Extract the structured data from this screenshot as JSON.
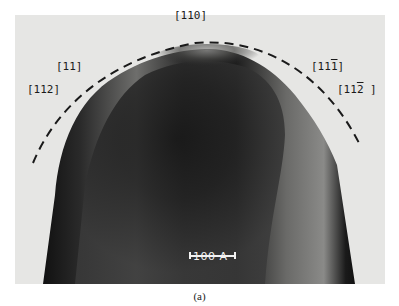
{
  "figure": {
    "caption": "(a)",
    "labels": {
      "top": "[110]",
      "upper_left": "[11]",
      "left": "[112]",
      "upper_right_prefix": "[11",
      "upper_right_bar_digit": "1",
      "upper_right_suffix": "]",
      "right_prefix": "[11",
      "right_bar_digit": "2",
      "right_suffix": " ]"
    },
    "scale_bar": {
      "label": "100 A"
    },
    "colors": {
      "background": "#e6e6e4",
      "specimen_dark": "#1c1c1c",
      "specimen_light": "#8a8a88",
      "dashed_outline": "#1a1a1a",
      "scale_bar": "#f2f2f2"
    }
  }
}
